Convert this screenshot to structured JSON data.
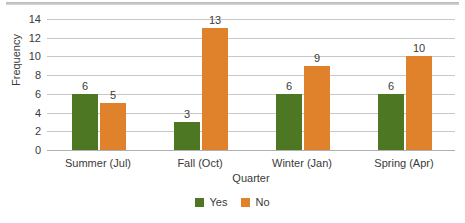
{
  "chart_data": {
    "type": "bar",
    "title": "",
    "subtitle": "",
    "xlabel": "Quarter",
    "ylabel": "Frequency",
    "categories": [
      "Summer (Jul)",
      "Fall (Oct)",
      "Winter (Jan)",
      "Spring (Apr)"
    ],
    "series": [
      {
        "name": "Yes",
        "color": "#4E7724",
        "values": [
          6,
          3,
          6,
          6
        ]
      },
      {
        "name": "No",
        "color": "#E0822B",
        "values": [
          5,
          13,
          9,
          10
        ]
      }
    ],
    "ylim": [
      0,
      14
    ],
    "ytick_labels": [
      "0",
      "2",
      "4",
      "6",
      "8",
      "10",
      "12",
      "14"
    ],
    "ytick_values": [
      0,
      2,
      4,
      6,
      8,
      10,
      12,
      14
    ],
    "grid": "horizontal",
    "legend_position": "bottom",
    "data_labels": true,
    "annotations": []
  },
  "colors": {
    "series_yes": "#4E7724",
    "series_no": "#E0822B",
    "gridline": "#c8c8c8",
    "baseline": "#b0b0b0",
    "text": "#3a3a3a",
    "top_band": "#b9b9b9"
  }
}
